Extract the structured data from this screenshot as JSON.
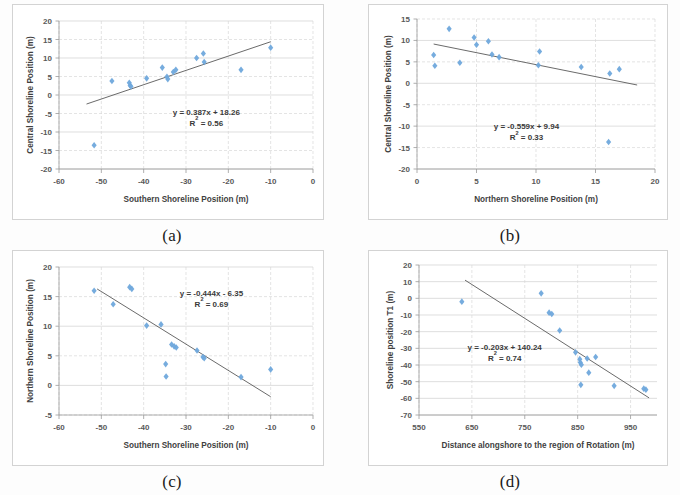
{
  "figure": {
    "background_color": "#ffffff",
    "marker_color": "#6fa8dc",
    "trendline_color": "#595959",
    "grid_color": "#d9d9d9"
  },
  "panels": [
    {
      "caption": "(a)",
      "equation": "y = 0.387x + 18.26",
      "r2_prefix": "R",
      "r2_sup": "2",
      "r2_value": " = 0.56"
    },
    {
      "caption": "(b)",
      "equation": "y = -0.559x + 9.94",
      "r2_prefix": "R",
      "r2_sup": "2",
      "r2_value": " = 0.33"
    },
    {
      "caption": "(c)",
      "equation": "y = -0.444x - 6.35",
      "r2_prefix": "R",
      "r2_sup": "2",
      "r2_value": " = 0.69"
    },
    {
      "caption": "(d)",
      "equation": "y = -0.203x + 140.24",
      "r2_prefix": "R",
      "r2_sup": "2",
      "r2_value": " = 0.74"
    }
  ],
  "chart_data": [
    {
      "panel": "(a)",
      "type": "scatter",
      "title": "",
      "xlabel": "Southern Shoreline Position (m)",
      "ylabel": "Central Shoreline Position (m)",
      "xlim": [
        -60,
        0
      ],
      "ylim": [
        -20,
        20
      ],
      "xticks": [
        -60,
        -50,
        -40,
        -30,
        -20,
        -10,
        0
      ],
      "yticks": [
        -20,
        -15,
        -10,
        -5,
        0,
        5,
        10,
        15,
        20
      ],
      "xtick_labels": [
        "-60",
        "-50",
        "-40",
        "-30",
        "-20",
        "-10",
        "0"
      ],
      "ytick_labels": [
        "-20",
        "-15",
        "-10",
        "-5",
        "0",
        "5",
        "10",
        "15",
        "20"
      ],
      "grid": true,
      "legend": "none",
      "annotations": [
        "y = 0.387x + 18.26",
        "R² = 0.56"
      ],
      "trendline": {
        "slope": 0.387,
        "intercept": 18.26,
        "r2": 0.56,
        "x_start": -53.5,
        "x_end": -10.0
      },
      "points": [
        {
          "x": -51.7,
          "y": -13.6
        },
        {
          "x": -47.5,
          "y": 3.8
        },
        {
          "x": -43.4,
          "y": 3.3
        },
        {
          "x": -43.2,
          "y": 2.6
        },
        {
          "x": -43.0,
          "y": 2.3
        },
        {
          "x": -39.3,
          "y": 4.5
        },
        {
          "x": -35.6,
          "y": 7.4
        },
        {
          "x": -34.5,
          "y": 4.9
        },
        {
          "x": -34.3,
          "y": 4.3
        },
        {
          "x": -33.0,
          "y": 6.2
        },
        {
          "x": -32.4,
          "y": 6.8
        },
        {
          "x": -27.5,
          "y": 10.0
        },
        {
          "x": -25.9,
          "y": 11.2
        },
        {
          "x": -25.7,
          "y": 8.9
        },
        {
          "x": -17.0,
          "y": 6.8
        },
        {
          "x": -10.0,
          "y": 12.8
        }
      ]
    },
    {
      "panel": "(b)",
      "type": "scatter",
      "title": "",
      "xlabel": "Northern Shoreline Position (m)",
      "ylabel": "Central Shoreline Position (m)",
      "xlim": [
        0,
        20
      ],
      "ylim": [
        -20,
        15
      ],
      "xticks": [
        0,
        5,
        10,
        15,
        20
      ],
      "yticks": [
        -20,
        -15,
        -10,
        -5,
        0,
        5,
        10,
        15
      ],
      "xtick_labels": [
        "0",
        "5",
        "10",
        "15",
        "20"
      ],
      "ytick_labels": [
        "-20",
        "-15",
        "-10",
        "-5",
        "0",
        "5",
        "10",
        "15"
      ],
      "grid": true,
      "legend": "none",
      "annotations": [
        "y = -0.559x + 9.94",
        "R² = 0.33"
      ],
      "trendline": {
        "slope": -0.559,
        "intercept": 9.94,
        "r2": 0.33,
        "x_start": 1.4,
        "x_end": 18.5
      },
      "points": [
        {
          "x": 1.4,
          "y": 6.6
        },
        {
          "x": 1.5,
          "y": 4.1
        },
        {
          "x": 2.7,
          "y": 12.7
        },
        {
          "x": 3.6,
          "y": 4.8
        },
        {
          "x": 4.8,
          "y": 10.7
        },
        {
          "x": 5.0,
          "y": 9.0
        },
        {
          "x": 6.0,
          "y": 9.8
        },
        {
          "x": 6.3,
          "y": 6.7
        },
        {
          "x": 6.9,
          "y": 6.1
        },
        {
          "x": 10.3,
          "y": 7.4
        },
        {
          "x": 10.2,
          "y": 4.2
        },
        {
          "x": 13.8,
          "y": 3.8
        },
        {
          "x": 16.2,
          "y": 2.3
        },
        {
          "x": 17.0,
          "y": 3.3
        },
        {
          "x": 16.1,
          "y": -13.7
        }
      ]
    },
    {
      "panel": "(c)",
      "type": "scatter",
      "title": "",
      "xlabel": "Southern Shoreline Position (m)",
      "ylabel": "Northern Shoreline Position (m)",
      "xlim": [
        -60,
        0
      ],
      "ylim": [
        -5,
        20
      ],
      "xticks": [
        -60,
        -50,
        -40,
        -30,
        -20,
        -10,
        0
      ],
      "yticks": [
        -5,
        0,
        5,
        10,
        15,
        20
      ],
      "xtick_labels": [
        "-60",
        "-50",
        "-40",
        "-30",
        "-20",
        "-10",
        "0"
      ],
      "ytick_labels": [
        "-5",
        "0",
        "5",
        "10",
        "15",
        "20"
      ],
      "grid": true,
      "legend": "none",
      "annotations": [
        "y = -0.444x - 6.35",
        "R² = 0.69"
      ],
      "trendline": {
        "slope": -0.444,
        "intercept": -6.35,
        "r2": 0.69,
        "x_start": -51.0,
        "x_end": -10.0
      },
      "points": [
        {
          "x": -51.7,
          "y": 16.0
        },
        {
          "x": -47.2,
          "y": 13.7
        },
        {
          "x": -43.3,
          "y": 16.6
        },
        {
          "x": -42.8,
          "y": 16.3
        },
        {
          "x": -39.3,
          "y": 10.1
        },
        {
          "x": -35.9,
          "y": 10.3
        },
        {
          "x": -33.4,
          "y": 6.9
        },
        {
          "x": -32.8,
          "y": 6.6
        },
        {
          "x": -32.3,
          "y": 6.4
        },
        {
          "x": -34.8,
          "y": 3.6
        },
        {
          "x": -34.7,
          "y": 1.5
        },
        {
          "x": -27.4,
          "y": 5.9
        },
        {
          "x": -26.0,
          "y": 4.8
        },
        {
          "x": -25.7,
          "y": 4.6
        },
        {
          "x": -17.0,
          "y": 1.4
        },
        {
          "x": -10.0,
          "y": 2.7
        }
      ]
    },
    {
      "panel": "(d)",
      "type": "scatter",
      "title": "",
      "xlabel": "Distance alongshore to the region of Rotation (m)",
      "ylabel": "Shoreline position T1 (m)",
      "xlim": [
        550,
        1000
      ],
      "ylim": [
        -70,
        20
      ],
      "xticks": [
        550,
        650,
        750,
        850,
        950
      ],
      "yticks": [
        -70,
        -60,
        -50,
        -40,
        -30,
        -20,
        -10,
        0,
        10,
        20
      ],
      "xtick_labels": [
        "550",
        "650",
        "750",
        "850",
        "950"
      ],
      "ytick_labels": [
        "-70",
        "-60",
        "-50",
        "-40",
        "-30",
        "-20",
        "-10",
        "0",
        "10",
        "20"
      ],
      "grid": true,
      "legend": "none",
      "annotations": [
        "y = -0.203x + 140.24",
        "R² = 0.74"
      ],
      "trendline": {
        "slope": -0.203,
        "intercept": 140.24,
        "r2": 0.74,
        "x_start": 637.0,
        "x_end": 985.0
      },
      "points": [
        {
          "x": 631,
          "y": -2.0
        },
        {
          "x": 781,
          "y": 3.0
        },
        {
          "x": 796,
          "y": -8.6
        },
        {
          "x": 801,
          "y": -9.4
        },
        {
          "x": 816,
          "y": -19.3
        },
        {
          "x": 846,
          "y": -32.4
        },
        {
          "x": 854,
          "y": -36.5
        },
        {
          "x": 855,
          "y": -38.5
        },
        {
          "x": 857,
          "y": -39.8
        },
        {
          "x": 868,
          "y": -36.1
        },
        {
          "x": 884,
          "y": -35.2
        },
        {
          "x": 871,
          "y": -44.6
        },
        {
          "x": 856,
          "y": -51.9
        },
        {
          "x": 919,
          "y": -52.5
        },
        {
          "x": 975,
          "y": -54.2
        },
        {
          "x": 979,
          "y": -54.8
        }
      ]
    }
  ]
}
